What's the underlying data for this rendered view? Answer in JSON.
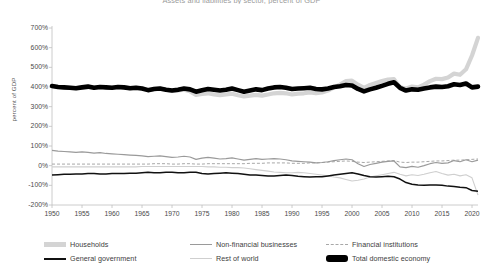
{
  "chart_data": {
    "type": "line",
    "title": "Assets and liabilities by sector, percent of GDP",
    "xlabel": "",
    "ylabel": "percent of GDP",
    "xlim": [
      1950,
      2021
    ],
    "ylim": [
      -200,
      700
    ],
    "ytick_labels": [
      "700%",
      "600%",
      "500%",
      "400%",
      "300%",
      "200%",
      "100%",
      "0%",
      "-100%",
      "-200%"
    ],
    "ytick_values": [
      700,
      600,
      500,
      400,
      300,
      200,
      100,
      0,
      -100,
      -200
    ],
    "xtick_labels": [
      "1950",
      "1955",
      "1960",
      "1965",
      "1970",
      "1975",
      "1980",
      "1985",
      "1990",
      "1995",
      "2000",
      "2005",
      "2010",
      "2015",
      "2020"
    ],
    "xtick_values": [
      1950,
      1955,
      1960,
      1965,
      1970,
      1975,
      1980,
      1985,
      1990,
      1995,
      2000,
      2005,
      2010,
      2015,
      2020
    ],
    "grid": false,
    "legend_position": "bottom",
    "x": [
      1950,
      1951,
      1952,
      1953,
      1954,
      1955,
      1956,
      1957,
      1958,
      1959,
      1960,
      1961,
      1962,
      1963,
      1964,
      1965,
      1966,
      1967,
      1968,
      1969,
      1970,
      1971,
      1972,
      1973,
      1974,
      1975,
      1976,
      1977,
      1978,
      1979,
      1980,
      1981,
      1982,
      1983,
      1984,
      1985,
      1986,
      1987,
      1988,
      1989,
      1990,
      1991,
      1992,
      1993,
      1994,
      1995,
      1996,
      1997,
      1998,
      1999,
      2000,
      2001,
      2002,
      2003,
      2004,
      2005,
      2006,
      2007,
      2008,
      2009,
      2010,
      2011,
      2012,
      2013,
      2014,
      2015,
      2016,
      2017,
      2018,
      2019,
      2020,
      2021
    ],
    "series": [
      {
        "name": "Households",
        "color": "#d4d4d4",
        "style": "thick-solid",
        "values": [
          405,
          400,
          398,
          396,
          394,
          398,
          400,
          396,
          400,
          398,
          396,
          400,
          398,
          394,
          396,
          394,
          385,
          390,
          392,
          386,
          380,
          382,
          386,
          378,
          360,
          365,
          368,
          362,
          358,
          362,
          366,
          358,
          352,
          356,
          360,
          356,
          362,
          368,
          370,
          368,
          362,
          366,
          368,
          372,
          368,
          372,
          382,
          398,
          412,
          430,
          432,
          412,
          396,
          410,
          420,
          430,
          438,
          440,
          398,
          392,
          402,
          398,
          412,
          430,
          442,
          440,
          448,
          468,
          462,
          490,
          560,
          650
        ]
      },
      {
        "name": "Non-financial businesses",
        "color": "#9a9a9a",
        "style": "thin-solid",
        "values": [
          78,
          74,
          72,
          70,
          68,
          70,
          68,
          64,
          66,
          62,
          60,
          58,
          56,
          54,
          52,
          50,
          46,
          48,
          50,
          46,
          42,
          44,
          48,
          44,
          32,
          38,
          42,
          38,
          34,
          36,
          40,
          34,
          28,
          32,
          36,
          32,
          34,
          36,
          34,
          30,
          24,
          22,
          20,
          18,
          14,
          16,
          20,
          26,
          30,
          34,
          30,
          10,
          -4,
          6,
          12,
          18,
          22,
          24,
          -6,
          -10,
          -4,
          -8,
          0,
          10,
          16,
          12,
          14,
          26,
          20,
          30,
          20,
          28
        ]
      },
      {
        "name": "Financial institutions",
        "color": "#a8a8a8",
        "style": "dashed",
        "values": [
          8,
          8,
          8,
          8,
          8,
          8,
          8,
          8,
          8,
          8,
          8,
          8,
          8,
          8,
          8,
          8,
          8,
          10,
          10,
          10,
          8,
          8,
          10,
          10,
          8,
          8,
          10,
          10,
          10,
          10,
          10,
          10,
          10,
          12,
          12,
          12,
          14,
          14,
          14,
          14,
          12,
          12,
          12,
          14,
          14,
          16,
          18,
          20,
          22,
          24,
          22,
          18,
          16,
          18,
          20,
          22,
          24,
          26,
          18,
          16,
          18,
          18,
          20,
          22,
          24,
          24,
          26,
          28,
          28,
          30,
          32,
          34
        ]
      },
      {
        "name": "General government",
        "color": "#111111",
        "style": "thin-solid-dark",
        "values": [
          -48,
          -46,
          -44,
          -44,
          -42,
          -42,
          -40,
          -40,
          -42,
          -42,
          -40,
          -40,
          -40,
          -38,
          -38,
          -36,
          -34,
          -36,
          -36,
          -34,
          -34,
          -36,
          -36,
          -34,
          -34,
          -40,
          -42,
          -40,
          -38,
          -36,
          -38,
          -40,
          -44,
          -48,
          -48,
          -50,
          -52,
          -52,
          -50,
          -48,
          -50,
          -54,
          -56,
          -58,
          -56,
          -56,
          -52,
          -48,
          -44,
          -40,
          -36,
          -42,
          -50,
          -56,
          -58,
          -56,
          -54,
          -56,
          -68,
          -86,
          -94,
          -98,
          -100,
          -98,
          -98,
          -100,
          -104,
          -106,
          -110,
          -112,
          -126,
          -130
        ]
      },
      {
        "name": "Rest of world",
        "color": "#cfcfcf",
        "style": "thin-light",
        "values": [
          -6,
          -6,
          -6,
          -6,
          -6,
          -6,
          -6,
          -6,
          -6,
          -6,
          -6,
          -6,
          -6,
          -6,
          -6,
          -4,
          -4,
          -4,
          -4,
          -4,
          -4,
          -4,
          -4,
          -4,
          -4,
          -4,
          -6,
          -6,
          -8,
          -8,
          -10,
          -10,
          -12,
          -16,
          -20,
          -24,
          -28,
          -32,
          -34,
          -36,
          -36,
          -34,
          -36,
          -40,
          -44,
          -48,
          -52,
          -58,
          -62,
          -70,
          -78,
          -74,
          -68,
          -58,
          -52,
          -46,
          -40,
          -34,
          -44,
          -52,
          -46,
          -50,
          -44,
          -36,
          -30,
          -40,
          -48,
          -44,
          -52,
          -46,
          -62,
          -150
        ]
      },
      {
        "name": "Total domestic economy",
        "color": "#000000",
        "style": "very-thick-solid",
        "values": [
          405,
          400,
          398,
          396,
          394,
          398,
          402,
          396,
          400,
          398,
          396,
          400,
          398,
          394,
          396,
          392,
          384,
          390,
          392,
          386,
          382,
          386,
          392,
          388,
          376,
          384,
          390,
          386,
          382,
          386,
          392,
          384,
          376,
          382,
          388,
          384,
          392,
          398,
          400,
          396,
          390,
          392,
          394,
          396,
          390,
          388,
          392,
          400,
          404,
          410,
          408,
          390,
          378,
          388,
          396,
          406,
          416,
          424,
          396,
          382,
          388,
          386,
          392,
          398,
          402,
          400,
          404,
          414,
          410,
          418,
          398,
          402
        ]
      }
    ]
  },
  "axes": {
    "y_axis_title": "percent of GDP"
  },
  "legend": {
    "items": [
      {
        "label": "Households",
        "swatch": "households-swatch"
      },
      {
        "label": "Non-financial businesses",
        "swatch": "nonfinancial-businesses-swatch"
      },
      {
        "label": "Financial institutions",
        "swatch": "financial-institutions-swatch"
      },
      {
        "label": "General government",
        "swatch": "general-government-swatch"
      },
      {
        "label": "Rest of world",
        "swatch": "rest-of-world-swatch"
      },
      {
        "label": "Total domestic economy",
        "swatch": "total-domestic-economy-swatch"
      }
    ]
  }
}
